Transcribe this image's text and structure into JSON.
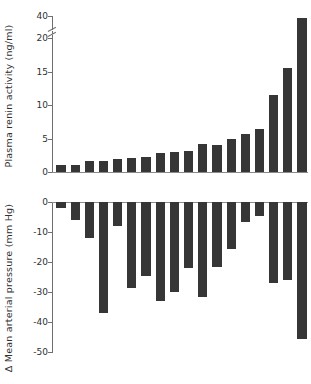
{
  "figure": {
    "type": "two-panel-bar-chart",
    "background_color": "#ffffff",
    "bar_color": "#363636",
    "axis_color": "#6f6f6f"
  },
  "panels": {
    "top": {
      "name": "plasma-renin-activity-panel",
      "axis_title": "Plasma renin activity (ng/ml)",
      "tick_labels": [
        "40",
        "20",
        "15",
        "10",
        "5",
        "0"
      ],
      "axis_break": true,
      "axis_break_between": [
        20,
        40
      ]
    },
    "bottom": {
      "name": "mean-arterial-pressure-panel",
      "axis_title": "Δ Mean arterial pressure (mm Hg)",
      "tick_labels": [
        "0",
        "-10",
        "-20",
        "-30",
        "-40",
        "-50"
      ]
    }
  },
  "chart_data": [
    {
      "type": "bar",
      "title": "Plasma renin activity (ng/ml)",
      "xlabel": "",
      "ylabel": "Plasma renin activity (ng/ml)",
      "ylim": [
        0,
        40
      ],
      "axis_break": {
        "from": 20,
        "to": 40
      },
      "yticks": [
        0,
        5,
        10,
        15,
        20,
        40
      ],
      "grid": false,
      "legend": "none",
      "orientation": "vertical",
      "categories": [
        "1",
        "2",
        "3",
        "4",
        "5",
        "6",
        "7",
        "8",
        "9",
        "10",
        "11",
        "12",
        "13",
        "14",
        "15",
        "16",
        "17",
        "18"
      ],
      "values": [
        1.0,
        1.0,
        1.6,
        1.6,
        2.0,
        2.1,
        2.3,
        2.8,
        3.0,
        3.1,
        4.2,
        4.0,
        5.0,
        5.6,
        6.4,
        11.5,
        15.5,
        21.0
      ],
      "note_last_value_scale": "final bar extends into broken upper segment near 38"
    },
    {
      "type": "bar",
      "title": "Δ Mean arterial pressure (mm Hg)",
      "xlabel": "",
      "ylabel": "Δ Mean arterial pressure (mm Hg)",
      "ylim": [
        -50,
        0
      ],
      "yticks": [
        0,
        -10,
        -20,
        -30,
        -40,
        -50
      ],
      "grid": false,
      "legend": "none",
      "orientation": "vertical",
      "categories": [
        "1",
        "2",
        "3",
        "4",
        "5",
        "6",
        "7",
        "8",
        "9",
        "10",
        "11",
        "12",
        "13",
        "14",
        "15",
        "16",
        "17",
        "18"
      ],
      "values": [
        -2.0,
        -6.0,
        -12.0,
        -37.0,
        -8.0,
        -28.5,
        -24.5,
        -33.0,
        -30.0,
        -22.0,
        -31.5,
        -21.5,
        -15.5,
        -6.5,
        -4.5,
        -27.0,
        -26.0,
        -45.5
      ]
    }
  ]
}
